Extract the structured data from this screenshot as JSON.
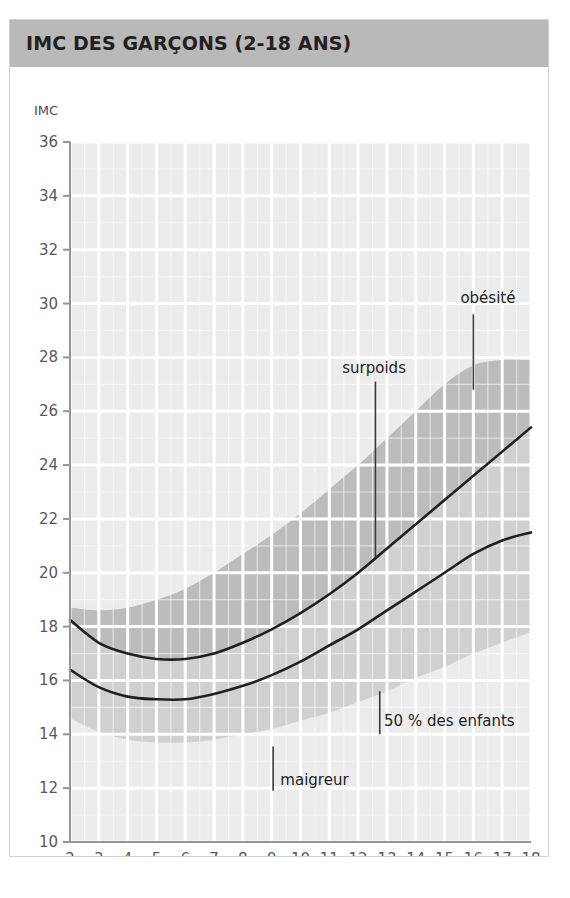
{
  "figure": {
    "title": "IMC DES GARÇONS (2-18 ANS)",
    "title_bar_color": "#b9b9b9",
    "border_color": "#d2d2d2",
    "background": "#ffffff"
  },
  "chart_data": {
    "type": "line",
    "title": "IMC DES GARÇONS (2-18 ANS)",
    "xlabel": "Âge (en années)",
    "ylabel": "IMC",
    "ylabel_position": "above-axis-top",
    "xlim": [
      2,
      18
    ],
    "ylim": [
      10,
      36
    ],
    "xticks": [
      2,
      3,
      4,
      5,
      6,
      7,
      8,
      9,
      10,
      11,
      12,
      13,
      14,
      15,
      16,
      17,
      18
    ],
    "yticks": [
      10,
      12,
      14,
      16,
      18,
      20,
      22,
      24,
      26,
      28,
      30,
      32,
      34,
      36
    ],
    "xtick_labels": [
      "2",
      "3",
      "4",
      "5",
      "6",
      "7",
      "8",
      "9",
      "10",
      "11",
      "12",
      "13",
      "14",
      "15",
      "16",
      "17",
      "18"
    ],
    "ytick_labels": [
      "10",
      "12",
      "14",
      "16",
      "18",
      "20",
      "22",
      "24",
      "26",
      "28",
      "30",
      "32",
      "34",
      "36"
    ],
    "grid": true,
    "grid_color": "#ffffff",
    "plot_background": "#ececec",
    "legend": "none",
    "series": [
      {
        "name": "surpoids",
        "type": "line",
        "color": "#231f20",
        "width": 2.6,
        "x": [
          2,
          3,
          4,
          5,
          6,
          7,
          8,
          9,
          10,
          11,
          12,
          13,
          14,
          15,
          16,
          17,
          18
        ],
        "values": [
          18.25,
          17.4,
          17.0,
          16.8,
          16.8,
          17.0,
          17.4,
          17.9,
          18.5,
          19.2,
          20.0,
          20.9,
          21.8,
          22.7,
          23.6,
          24.5,
          25.4
        ]
      },
      {
        "name": "50 % des enfants",
        "type": "line",
        "color": "#231f20",
        "width": 2.6,
        "x": [
          2,
          3,
          4,
          5,
          6,
          7,
          8,
          9,
          10,
          11,
          12,
          13,
          14,
          15,
          16,
          17,
          18
        ],
        "values": [
          16.4,
          15.75,
          15.4,
          15.3,
          15.3,
          15.5,
          15.8,
          16.2,
          16.7,
          17.3,
          17.9,
          18.6,
          19.3,
          20.0,
          20.7,
          21.2,
          21.5
        ]
      }
    ],
    "bands": [
      {
        "name": "maigreur-to-surpoids-band",
        "color": "#d0d0d0",
        "description": "medium gray band covering normal weight zone",
        "x": [
          2,
          3,
          4,
          5,
          6,
          7,
          8,
          9,
          10,
          11,
          12,
          13,
          14,
          15,
          16,
          17,
          18
        ],
        "upper": [
          18.7,
          18.6,
          18.7,
          19.0,
          19.4,
          20.0,
          20.7,
          21.4,
          22.2,
          23.1,
          24.0,
          25.0,
          26.0,
          27.0,
          27.7,
          27.9,
          27.9
        ],
        "lower": [
          14.6,
          14.1,
          13.8,
          13.7,
          13.7,
          13.8,
          14.0,
          14.2,
          14.5,
          14.8,
          15.2,
          15.6,
          16.1,
          16.5,
          17.0,
          17.4,
          17.8
        ]
      },
      {
        "name": "obesite-band",
        "color": "#bcbcbc",
        "description": "darker gray wedge above the surpoids curve indicating obesity zone",
        "x": [
          2,
          3,
          4,
          5,
          6,
          7,
          8,
          9,
          10,
          11,
          12,
          13,
          14,
          15,
          16,
          17,
          18
        ],
        "upper": [
          18.7,
          18.6,
          18.7,
          19.0,
          19.4,
          20.0,
          20.7,
          21.4,
          22.2,
          23.1,
          24.0,
          25.0,
          26.0,
          27.0,
          27.7,
          27.9,
          27.9
        ],
        "lower": [
          18.25,
          17.4,
          17.0,
          16.8,
          16.8,
          17.0,
          17.4,
          17.9,
          18.5,
          19.2,
          20.0,
          20.9,
          21.8,
          22.7,
          23.6,
          24.5,
          25.4
        ]
      }
    ],
    "annotations": [
      {
        "name": "obesite",
        "text": "obésité",
        "label_x": 15.55,
        "label_y": 30.2,
        "leader_from": [
          16.0,
          29.6
        ],
        "leader_to": [
          16.0,
          26.8
        ]
      },
      {
        "name": "surpoids",
        "text": "surpoids",
        "label_x": 11.45,
        "label_y": 27.6,
        "leader_from": [
          12.6,
          27.1
        ],
        "leader_to": [
          12.6,
          20.55
        ]
      },
      {
        "name": "cinquante-pourcent-des-enfants",
        "text": "50 % des enfants",
        "label_x": 12.9,
        "label_y": 14.5,
        "leader_from": [
          12.75,
          15.6
        ],
        "leader_to": [
          12.75,
          14.0
        ]
      },
      {
        "name": "maigreur",
        "text": "maigreur",
        "label_x": 9.3,
        "label_y": 12.3,
        "leader_from": [
          9.05,
          13.55
        ],
        "leader_to": [
          9.05,
          11.9
        ]
      }
    ]
  }
}
